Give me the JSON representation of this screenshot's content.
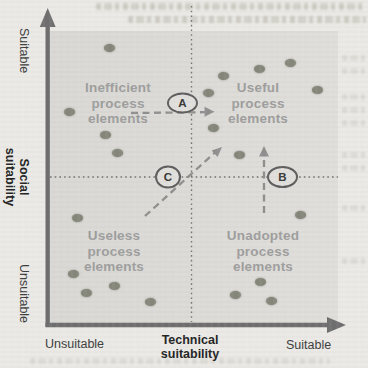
{
  "figure": {
    "type": "quadrant-scatter-diagram",
    "y_axis": {
      "title": "Social\nsuitability",
      "top_cap": "Suitable",
      "bottom_cap": "Unsuitable"
    },
    "x_axis": {
      "title": "Technical\nsuitability",
      "left_cap": "Unsuitable",
      "right_cap": "Suitable"
    },
    "quadrants": {
      "top_left": "Inefficient\nprocess\nelements",
      "top_right": "Useful\nprocess\nelements",
      "bottom_left": "Useless\nprocess\nelements",
      "bottom_right": "Unadopted\nprocess\nelements"
    },
    "badges": {
      "a": "A",
      "b": "B",
      "c": "C"
    },
    "colors": {
      "page_bg": "#eae9e5",
      "plot_bg": "#dcdbd7",
      "axis": "#6e6e6e",
      "divider": "#5f5f5f",
      "dashed_arrow": "#8f8f8f",
      "dot": "#85867a",
      "quadrant_text": "#9d9d9d"
    },
    "points": [
      [
        109,
        48
      ],
      [
        69,
        112
      ],
      [
        105,
        135
      ],
      [
        117,
        153
      ],
      [
        290,
        63
      ],
      [
        259,
        69
      ],
      [
        223,
        76
      ],
      [
        208,
        93
      ],
      [
        317,
        90
      ],
      [
        213,
        128
      ],
      [
        239,
        155
      ],
      [
        77,
        218
      ],
      [
        73,
        274
      ],
      [
        86,
        293
      ],
      [
        114,
        286
      ],
      [
        150,
        302
      ],
      [
        300,
        215
      ],
      [
        260,
        282
      ],
      [
        235,
        295
      ],
      [
        271,
        301
      ]
    ]
  }
}
